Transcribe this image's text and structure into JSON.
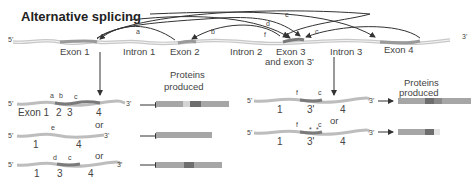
{
  "title": "Alternative splicing",
  "gene": {
    "five_prime": "5'",
    "three_prime": "3'",
    "regions": [
      "Exon 1",
      "Intron 1",
      "Exon 2",
      "Intron 2",
      "Exon 3",
      "and exon 3'",
      "Intron 3",
      "Exon 4"
    ],
    "splice_labels": [
      "a",
      "b",
      "c",
      "d",
      "e",
      "f"
    ]
  },
  "left": {
    "heading": [
      "Proteins",
      "produced"
    ],
    "or": "or",
    "variants": [
      {
        "labels": [
          "Exon 1",
          "2",
          "3",
          "4"
        ],
        "sites": [
          "a",
          "b",
          "c"
        ]
      },
      {
        "labels": [
          "1",
          "4"
        ],
        "sites": [
          "e"
        ]
      },
      {
        "labels": [
          "1",
          "3",
          "4"
        ],
        "sites": [
          "d",
          "c"
        ]
      }
    ]
  },
  "right": {
    "heading": [
      "Proteins",
      "produced"
    ],
    "or": "or",
    "variants": [
      {
        "labels": [
          "1",
          "3'",
          "4"
        ],
        "sites": [
          "f",
          "c"
        ]
      },
      {
        "labels": [
          "1",
          "3'",
          "4"
        ],
        "sites": [
          "f",
          "c"
        ],
        "stop_marks": [
          "*",
          "*"
        ]
      }
    ]
  },
  "colors": {
    "strand": "#bdbdbd",
    "strand_dark": "#8a8a8a",
    "protein": "#a6a6a6",
    "protein_dark": "#6e6e6e",
    "protein_light": "#d8d8d8"
  }
}
